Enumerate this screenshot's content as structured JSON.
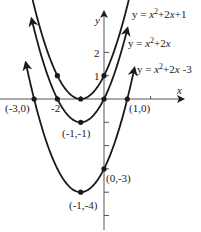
{
  "figure": {
    "type": "parabola-graph",
    "axes": {
      "x_label": "x",
      "y_label": "y",
      "origin_px": [
        104,
        99
      ],
      "unit_px": 23.3,
      "x_ticks": [
        -3,
        -2,
        -1,
        1,
        2
      ],
      "y_ticks": [
        -5,
        -4,
        -3,
        -2,
        -1,
        1,
        2
      ],
      "x_tick_labels": [
        {
          "value": -2,
          "text": "-2"
        }
      ],
      "y_tick_labels": [
        {
          "value": 1,
          "text": "1"
        },
        {
          "value": 2,
          "text": "2"
        }
      ]
    },
    "curves": [
      {
        "id": "c1",
        "equation": "y = x² + 2x + 1",
        "a": 1,
        "b": 2,
        "c": 1,
        "x_range": [
          -3.35,
          1.25
        ],
        "label_parts": {
          "pre": "y = ",
          "x1": "x",
          "sup": "2",
          "mid": "+2",
          "x2": "x",
          "post": "+1"
        }
      },
      {
        "id": "c2",
        "equation": "y = x² + 2x",
        "a": 1,
        "b": 2,
        "c": 0,
        "x_range": [
          -3.1,
          1.0
        ],
        "label_parts": {
          "pre": "y = ",
          "x1": "x",
          "sup": "2",
          "mid": "+2",
          "x2": "x",
          "post": ""
        }
      },
      {
        "id": "c3",
        "equation": "y = x² + 2x -3",
        "a": 1,
        "b": 2,
        "c": -3,
        "x_range": [
          -3.35,
          1.3
        ],
        "label_parts": {
          "pre": "y = ",
          "x1": "x",
          "sup": "2",
          "mid": "+2",
          "x2": "x",
          "post": " -3"
        }
      }
    ],
    "points": [
      {
        "x": -3,
        "y": 0,
        "label": "(-3,0)"
      },
      {
        "x": -2,
        "y": 0,
        "label": "-2"
      },
      {
        "x": -2,
        "y": 1,
        "label": ""
      },
      {
        "x": -1,
        "y": 0,
        "label": ""
      },
      {
        "x": 0,
        "y": 1,
        "label": "1"
      },
      {
        "x": 0,
        "y": 0,
        "label": ""
      },
      {
        "x": 1,
        "y": 0,
        "label": "(1,0)"
      },
      {
        "x": -1,
        "y": -1,
        "label": "(-1,-1)"
      },
      {
        "x": 0,
        "y": -3,
        "label": "(0,-3)"
      },
      {
        "x": -1,
        "y": -4,
        "label": "(-1,-4)"
      }
    ],
    "point_labels": {
      "p_m3_0": "(-3,0)",
      "p_m2": "-2",
      "p_1_0": "(1,0)",
      "p_m1_m1": "(-1,-1)",
      "p_0_m3": "(0,-3)",
      "p_m1_m4": "(-1,-4)",
      "tick_1": "1",
      "tick_2": "2"
    },
    "colors": {
      "ink": "#1a1a1a"
    }
  }
}
